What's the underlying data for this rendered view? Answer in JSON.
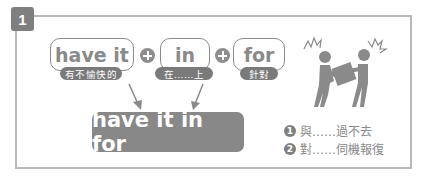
{
  "badge": {
    "number": "1"
  },
  "words": [
    {
      "text": "have it",
      "meaning": "有不愉快的"
    },
    {
      "text": "in",
      "meaning": "在……上"
    },
    {
      "text": "for",
      "meaning": "針對"
    }
  ],
  "result": {
    "phrase": "have it in for"
  },
  "meanings": [
    {
      "num": "1",
      "text": "與……過不去"
    },
    {
      "num": "2",
      "text": "對……伺機報復"
    }
  ],
  "icons": {
    "illustration": "two-people-arguing-illustration",
    "plus": "plus-circle-icon",
    "arrow": "arrow-down-icon"
  },
  "colors": {
    "accent": "#7f7f7f",
    "border": "#b9b9b9",
    "text": "#8a8a8a"
  }
}
